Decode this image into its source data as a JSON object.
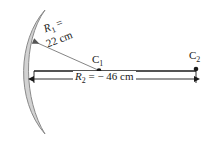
{
  "figure": {
    "background_color": "#ffffff",
    "stroke_color": "#1a1a1a",
    "lens_fill_color": "#d2d2d2",
    "lens_stroke_color": "#8a8a8a"
  },
  "labels": {
    "r1_symbol": "R",
    "r1_subscript": "1",
    "r1_equals": " =",
    "r1_value": "22 cm",
    "r2_symbol": "R",
    "r2_subscript": "2",
    "r2_value": " = − 46 cm",
    "c1_symbol": "C",
    "c1_subscript": "1",
    "c2_symbol": "C",
    "c2_subscript": "2"
  },
  "geometry": {
    "lens_top_tip": "45,10",
    "lens_bottom_tip": "45,134",
    "axis_line_y": 71,
    "axis_line_x_start": 34,
    "axis_line_x_end": 196,
    "dimension_line_y": 79,
    "dimension_x_start": 33,
    "dimension_x_end": 196,
    "c1_point": "99,71",
    "c2_point": "196,71",
    "r1_arrow_tip": "32,41",
    "r1_arrow_tail": "98,70"
  }
}
